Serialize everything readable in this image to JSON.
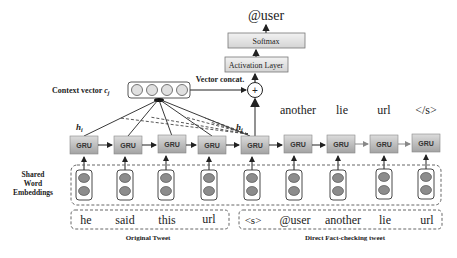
{
  "output": {
    "label": "@user"
  },
  "softmax": {
    "label": "Softmax"
  },
  "activation": {
    "label": "Activation Layer"
  },
  "concat": {
    "label": "Vector concat.",
    "symbol": "+"
  },
  "context": {
    "label": "Context vector",
    "symbol": "c",
    "subscript": "j",
    "cells": 4
  },
  "hidden": {
    "hi_label": "h",
    "hi_sub": "i",
    "hj_label": "h",
    "hj_sub": "j"
  },
  "gru": {
    "label": "GRU",
    "units": [
      {
        "x": 70
      },
      {
        "x": 114
      },
      {
        "x": 158
      },
      {
        "x": 198
      },
      {
        "x": 242
      },
      {
        "x": 284
      },
      {
        "x": 328
      },
      {
        "x": 370
      },
      {
        "x": 412
      }
    ]
  },
  "decoder_outputs": [
    "another",
    "lie",
    "url",
    "</s>"
  ],
  "embeddings": {
    "label_line1": "Shared",
    "label_line2": "Word",
    "label_line3": "Embeddings"
  },
  "original_tweet": {
    "caption": "Original Tweet",
    "tokens": [
      "he",
      "said",
      "this",
      "url"
    ]
  },
  "fact_check_tweet": {
    "caption": "Direct Fact-checking tweet",
    "tokens": [
      "<s>",
      "@user",
      "another",
      "lie",
      "url"
    ]
  },
  "colors": {
    "gru_fill_top": "#d9d9d9",
    "gru_fill_bottom": "#9e9e9e",
    "box_fill": "#e6e6e6",
    "cell_fill": "#8c8c8c",
    "line": "#222222",
    "dash": "#555555"
  }
}
